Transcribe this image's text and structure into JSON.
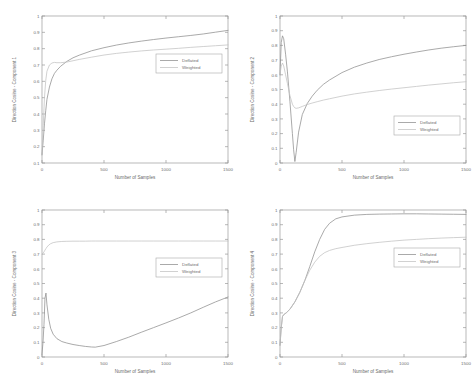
{
  "figure": {
    "layout": "2x2 subplot grid",
    "background": "#ffffff",
    "colors": {
      "deflated": "#8d8d8d",
      "weighted": "#c2c2c2",
      "axis": "#9a9a9a",
      "text": "#6e6e6e"
    }
  },
  "chart_data": [
    {
      "type": "line",
      "title": "",
      "xlabel": "Number of Samples",
      "ylabel": "Direction Cosine - Component 1",
      "xlim": [
        0,
        1500
      ],
      "ylim": [
        0.1,
        1
      ],
      "xticks": [
        0,
        500,
        1000,
        1500
      ],
      "xticklabels": [
        "0",
        "500",
        "1000",
        "1500"
      ],
      "yticks": [
        0.1,
        0.2,
        0.3,
        0.4,
        0.5,
        0.6,
        0.7,
        0.8,
        0.9,
        1
      ],
      "yticklabels": [
        "0.1",
        "0.2",
        "0.3",
        "0.4",
        "0.5",
        "0.6",
        "0.7",
        "0.8",
        "0.9",
        "1"
      ],
      "grid": false,
      "legend": {
        "entries": [
          "Deflated",
          "Weighted"
        ],
        "position": "center-right"
      },
      "x": [
        0,
        10,
        20,
        30,
        40,
        60,
        80,
        100,
        120,
        150,
        200,
        250,
        300,
        400,
        500,
        600,
        700,
        800,
        900,
        1000,
        1100,
        1200,
        1300,
        1400,
        1500
      ],
      "series": [
        {
          "name": "Deflated",
          "values": [
            0.15,
            0.24,
            0.34,
            0.42,
            0.49,
            0.565,
            0.615,
            0.648,
            0.668,
            0.692,
            0.722,
            0.744,
            0.76,
            0.787,
            0.806,
            0.822,
            0.835,
            0.846,
            0.856,
            0.865,
            0.873,
            0.881,
            0.89,
            0.901,
            0.912
          ]
        },
        {
          "name": "Weighted",
          "values": [
            0.15,
            0.33,
            0.5,
            0.605,
            0.662,
            0.7,
            0.712,
            0.716,
            0.714,
            0.714,
            0.718,
            0.726,
            0.734,
            0.748,
            0.761,
            0.771,
            0.779,
            0.786,
            0.792,
            0.797,
            0.802,
            0.808,
            0.813,
            0.818,
            0.823
          ]
        }
      ]
    },
    {
      "type": "line",
      "title": "",
      "xlabel": "Number of Samples",
      "ylabel": "Direction Cosine - Component 2",
      "xlim": [
        0,
        1500
      ],
      "ylim": [
        0,
        1
      ],
      "xticks": [
        0,
        500,
        1000,
        1500
      ],
      "xticklabels": [
        "0",
        "500",
        "1000",
        "1500"
      ],
      "yticks": [
        0,
        0.1,
        0.2,
        0.3,
        0.4,
        0.5,
        0.6,
        0.7,
        0.8,
        0.9,
        1
      ],
      "yticklabels": [
        "0",
        "0.1",
        "0.2",
        "0.3",
        "0.4",
        "0.5",
        "0.6",
        "0.7",
        "0.8",
        "0.9",
        "1"
      ],
      "grid": false,
      "legend": {
        "entries": [
          "Deflated",
          "Weighted"
        ],
        "position": "lower-right"
      },
      "x": [
        0,
        10,
        20,
        30,
        45,
        60,
        80,
        100,
        110,
        120,
        130,
        150,
        180,
        220,
        260,
        300,
        350,
        400,
        500,
        600,
        700,
        800,
        900,
        1000,
        1100,
        1200,
        1300,
        1400,
        1500
      ],
      "series": [
        {
          "name": "Deflated",
          "values": [
            0.6,
            0.82,
            0.865,
            0.845,
            0.74,
            0.62,
            0.42,
            0.2,
            0.09,
            0.01,
            0.07,
            0.21,
            0.33,
            0.405,
            0.455,
            0.495,
            0.535,
            0.565,
            0.615,
            0.652,
            0.68,
            0.704,
            0.723,
            0.74,
            0.755,
            0.769,
            0.781,
            0.791,
            0.8
          ]
        },
        {
          "name": "Weighted",
          "values": [
            0.6,
            0.66,
            0.68,
            0.66,
            0.6,
            0.54,
            0.46,
            0.4,
            0.385,
            0.375,
            0.372,
            0.375,
            0.385,
            0.398,
            0.408,
            0.417,
            0.428,
            0.437,
            0.455,
            0.47,
            0.482,
            0.493,
            0.503,
            0.512,
            0.521,
            0.53,
            0.538,
            0.546,
            0.553
          ]
        }
      ]
    },
    {
      "type": "line",
      "title": "",
      "xlabel": "Number of Samples",
      "ylabel": "Direction Cosine - Component 3",
      "xlim": [
        0,
        1500
      ],
      "ylim": [
        0,
        1
      ],
      "xticks": [
        0,
        500,
        1000,
        1500
      ],
      "xticklabels": [
        "0",
        "500",
        "1000",
        "1500"
      ],
      "yticks": [
        0,
        0.1,
        0.2,
        0.3,
        0.4,
        0.5,
        0.6,
        0.7,
        0.8,
        0.9,
        1
      ],
      "yticklabels": [
        "0",
        "0.1",
        "0.2",
        "0.3",
        "0.4",
        "0.5",
        "0.6",
        "0.7",
        "0.8",
        "0.9",
        "1"
      ],
      "grid": false,
      "legend": {
        "entries": [
          "Deflated",
          "Weighted"
        ],
        "position": "upper-right"
      },
      "x": [
        0,
        8,
        16,
        24,
        32,
        40,
        55,
        70,
        90,
        120,
        160,
        200,
        250,
        300,
        350,
        400,
        430,
        500,
        600,
        700,
        800,
        900,
        1000,
        1100,
        1200,
        1300,
        1400,
        1500
      ],
      "series": [
        {
          "name": "Deflated",
          "values": [
            0.02,
            0.1,
            0.22,
            0.4,
            0.435,
            0.355,
            0.255,
            0.195,
            0.155,
            0.125,
            0.105,
            0.095,
            0.085,
            0.078,
            0.072,
            0.068,
            0.067,
            0.078,
            0.105,
            0.135,
            0.168,
            0.2,
            0.232,
            0.265,
            0.3,
            0.338,
            0.375,
            0.408
          ]
        },
        {
          "name": "Weighted",
          "values": [
            0.7,
            0.705,
            0.715,
            0.727,
            0.738,
            0.748,
            0.762,
            0.771,
            0.778,
            0.783,
            0.786,
            0.787,
            0.788,
            0.788,
            0.788,
            0.789,
            0.789,
            0.789,
            0.789,
            0.789,
            0.789,
            0.789,
            0.789,
            0.789,
            0.789,
            0.789,
            0.789,
            0.789
          ]
        }
      ]
    },
    {
      "type": "line",
      "title": "",
      "xlabel": "Number of Samples",
      "ylabel": "Direction Cosine - Component 4",
      "xlim": [
        0,
        1500
      ],
      "ylim": [
        0,
        1
      ],
      "xticks": [
        0,
        500,
        1000,
        1500
      ],
      "xticklabels": [
        "0",
        "500",
        "1000",
        "1500"
      ],
      "yticks": [
        0,
        0.1,
        0.2,
        0.3,
        0.4,
        0.5,
        0.6,
        0.7,
        0.8,
        0.9,
        1
      ],
      "yticklabels": [
        "0",
        "0.1",
        "0.2",
        "0.3",
        "0.4",
        "0.5",
        "0.6",
        "0.7",
        "0.8",
        "0.9",
        "1"
      ],
      "grid": false,
      "legend": {
        "entries": [
          "Deflated",
          "Weighted"
        ],
        "position": "center-right"
      },
      "x": [
        0,
        10,
        20,
        30,
        50,
        80,
        120,
        160,
        200,
        240,
        280,
        320,
        360,
        400,
        450,
        500,
        600,
        700,
        800,
        900,
        1000,
        1100,
        1200,
        1300,
        1400,
        1500
      ],
      "series": [
        {
          "name": "Deflated",
          "values": [
            0.08,
            0.2,
            0.275,
            0.288,
            0.3,
            0.325,
            0.375,
            0.44,
            0.52,
            0.615,
            0.715,
            0.8,
            0.868,
            0.91,
            0.94,
            0.953,
            0.965,
            0.97,
            0.972,
            0.973,
            0.974,
            0.974,
            0.973,
            0.972,
            0.971,
            0.97
          ]
        },
        {
          "name": "Weighted",
          "values": [
            0.08,
            0.2,
            0.275,
            0.288,
            0.3,
            0.325,
            0.375,
            0.44,
            0.52,
            0.59,
            0.645,
            0.685,
            0.71,
            0.725,
            0.737,
            0.745,
            0.76,
            0.771,
            0.78,
            0.788,
            0.795,
            0.8,
            0.805,
            0.809,
            0.812,
            0.815
          ]
        }
      ]
    }
  ]
}
